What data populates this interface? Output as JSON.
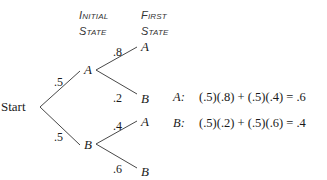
{
  "headers": {
    "initial_state": [
      "Initial",
      "State"
    ],
    "first_state": [
      "First",
      "State"
    ]
  },
  "tree": {
    "root": "Start",
    "level1": [
      {
        "node": "A",
        "prob": ".5"
      },
      {
        "node": "B",
        "prob": ".5"
      }
    ],
    "level2": [
      {
        "parent": "A",
        "node": "A",
        "prob": ".8"
      },
      {
        "parent": "A",
        "node": "B",
        "prob": ".2"
      },
      {
        "parent": "B",
        "node": "A",
        "prob": ".4"
      },
      {
        "parent": "B",
        "node": "B",
        "prob": ".6"
      }
    ]
  },
  "equations": [
    {
      "label": "A:",
      "expr": "(.5)(.8) + (.5)(.4) = .6"
    },
    {
      "label": "B:",
      "expr": "(.5)(.2) + (.5)(.6) = .4"
    }
  ],
  "colors": {
    "line": "#333333",
    "text": "#1a1a1a"
  }
}
